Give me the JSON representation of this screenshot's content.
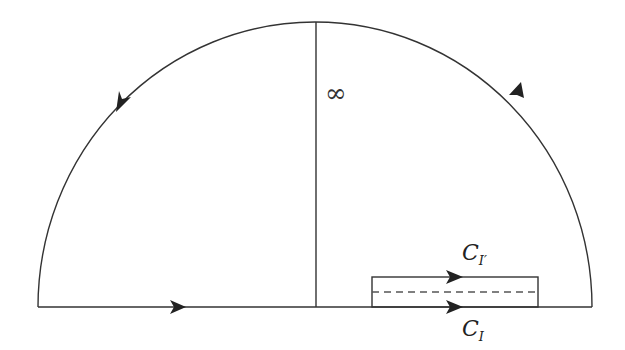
{
  "diagram": {
    "type": "contour",
    "labels": {
      "infinity": "∞",
      "upper_contour": "C",
      "upper_contour_sub": "I′",
      "lower_contour": "C",
      "lower_contour_sub": "I"
    },
    "colors": {
      "stroke": "#333333",
      "dashed": "#555555",
      "background": "#ffffff"
    }
  }
}
